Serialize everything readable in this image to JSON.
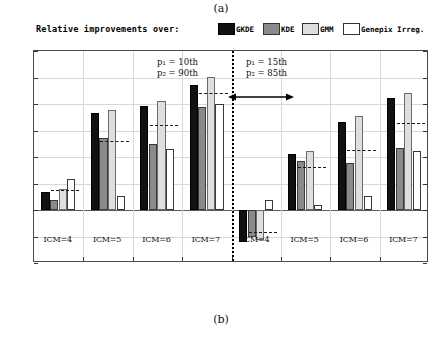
{
  "figure": {
    "sublabel_top": "(a)",
    "sublabel_bottom": "(b)"
  },
  "legend": {
    "title": "Relative improvements over:",
    "entries": [
      {
        "label": "GKDE",
        "color": "#111111"
      },
      {
        "label": "KDE",
        "color": "#8a8a8a"
      },
      {
        "label": "GMM",
        "color": "#dedede"
      },
      {
        "label": "Genepix Irreg.",
        "color": "#ffffff"
      }
    ]
  },
  "annotations": {
    "left": {
      "line1": "p₁ = 10th",
      "line2": "p₂ = 90th"
    },
    "right": {
      "line1": "p₁ = 15th",
      "line2": "p₂ = 85th"
    }
  },
  "axis": {
    "yticks": [
      "6",
      "5",
      "4",
      "3",
      "2",
      "1",
      "0",
      "-1",
      "-2"
    ],
    "ymin": -2,
    "ymax": 6
  },
  "chart_data": {
    "type": "bar",
    "title": "Relative improvements over:",
    "xlabel": "",
    "ylabel": "",
    "ylim": [
      -2,
      6
    ],
    "yticks": [
      -2,
      -1,
      0,
      1,
      2,
      3,
      4,
      5,
      6
    ],
    "grid": true,
    "legend_position": "top-right",
    "categories": [
      "ICM=4",
      "ICM=5",
      "ICM=6",
      "ICM=7",
      "ICM=4",
      "ICM=5",
      "ICM=6",
      "ICM=7"
    ],
    "panels": [
      {
        "name": "p1 = 10th, p2 = 90th",
        "categories": [
          "ICM=4",
          "ICM=5",
          "ICM=6",
          "ICM=7"
        ]
      },
      {
        "name": "p1 = 15th, p2 = 85th",
        "categories": [
          "ICM=4",
          "ICM=5",
          "ICM=6",
          "ICM=7"
        ]
      }
    ],
    "series": [
      {
        "name": "GKDE",
        "values": [
          0.67,
          3.66,
          3.93,
          4.7,
          -1.2,
          2.13,
          3.33,
          4.23
        ]
      },
      {
        "name": "KDE",
        "values": [
          0.37,
          2.71,
          2.48,
          3.9,
          -1.02,
          1.84,
          1.79,
          2.33
        ]
      },
      {
        "name": "GMM",
        "values": [
          0.78,
          3.77,
          4.13,
          5.03,
          -1.15,
          2.23,
          3.56,
          4.43
        ]
      },
      {
        "name": "Genepix Irreg.",
        "values": [
          1.17,
          0.53,
          2.3,
          4.01,
          0.39,
          0.18,
          0.53,
          2.23
        ]
      }
    ],
    "group_means": [
      0.75,
      2.62,
      3.2,
      4.4,
      -0.82,
      1.62,
      2.28,
      3.3
    ],
    "mean_marker": "dashed horizontal line per group"
  }
}
